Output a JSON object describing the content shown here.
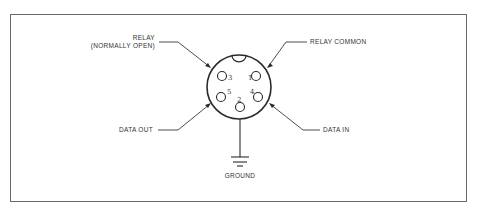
{
  "diagram": {
    "type": "connector-pinout",
    "connector": {
      "shape": "circular",
      "key_notch": "top",
      "pins": [
        {
          "number": "1",
          "position": "upper-right"
        },
        {
          "number": "2",
          "position": "bottom-center"
        },
        {
          "number": "3",
          "position": "upper-left"
        },
        {
          "number": "4",
          "position": "lower-right"
        },
        {
          "number": "5",
          "position": "lower-left"
        }
      ]
    },
    "labels": {
      "relay_line1": "RELAY",
      "relay_line2": "(NORMALLY OPEN)",
      "relay_common": "RELAY COMMON",
      "data_out": "DATA OUT",
      "data_in": "DATA IN",
      "ground": "GROUND"
    },
    "colors": {
      "line": "#3a3a3a",
      "frame": "#6a6a6a",
      "background": "#ffffff"
    }
  }
}
